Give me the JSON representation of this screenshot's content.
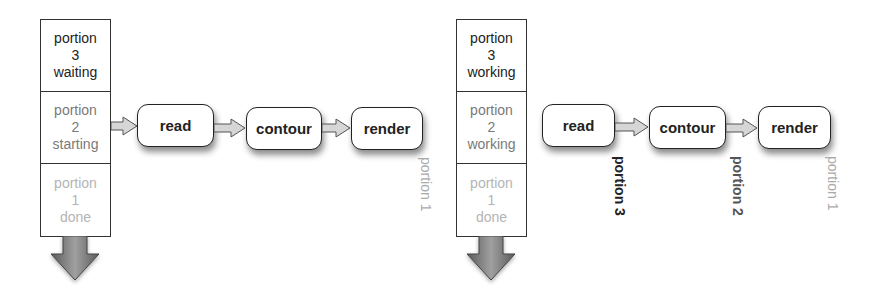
{
  "diagram": {
    "left": {
      "stack": [
        {
          "word": "portion",
          "num": "3",
          "state": "waiting",
          "tone": "dark"
        },
        {
          "word": "portion",
          "num": "2",
          "state": "starting",
          "tone": "mid"
        },
        {
          "word": "portion",
          "num": "1",
          "state": "done",
          "tone": "light"
        }
      ],
      "pipeline": [
        "read",
        "contour",
        "render"
      ],
      "stage_labels": [
        {
          "stage": "render",
          "text": "portion 1",
          "tone": "light"
        }
      ]
    },
    "right": {
      "stack": [
        {
          "word": "portion",
          "num": "3",
          "state": "working",
          "tone": "dark"
        },
        {
          "word": "portion",
          "num": "2",
          "state": "working",
          "tone": "mid"
        },
        {
          "word": "portion",
          "num": "1",
          "state": "done",
          "tone": "light"
        }
      ],
      "pipeline": [
        "read",
        "contour",
        "render"
      ],
      "stage_labels": [
        {
          "stage": "read",
          "text": "portion 3",
          "tone": "bold"
        },
        {
          "stage": "contour",
          "text": "portion 2",
          "tone": "mid"
        },
        {
          "stage": "render",
          "text": "portion 1",
          "tone": "light"
        }
      ]
    },
    "colors": {
      "line": "#222222",
      "arrow_fill": "#d0d0d0",
      "down_arrow_dark": "#555555",
      "down_arrow_light": "#9a9a9a"
    }
  }
}
